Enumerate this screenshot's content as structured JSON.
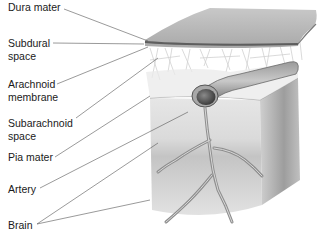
{
  "diagram": {
    "labels": [
      {
        "id": "dura-mater",
        "lines": [
          "Dura mater"
        ],
        "x": 8,
        "y": 1
      },
      {
        "id": "subdural-space",
        "lines": [
          "Subdural",
          "space"
        ],
        "x": 8,
        "y": 37
      },
      {
        "id": "arachnoid-membrane",
        "lines": [
          "Arachnoid",
          "membrane"
        ],
        "x": 8,
        "y": 78
      },
      {
        "id": "subarachnoid-space",
        "lines": [
          "Subarachnoid",
          "space"
        ],
        "x": 8,
        "y": 117
      },
      {
        "id": "pia-mater",
        "lines": [
          "Pia mater"
        ],
        "x": 8,
        "y": 154
      },
      {
        "id": "artery",
        "lines": [
          "Artery"
        ],
        "x": 8,
        "y": 186
      },
      {
        "id": "brain",
        "lines": [
          "Brain"
        ],
        "x": 8,
        "y": 220
      }
    ],
    "colors": {
      "dura": "#b3b3b3",
      "dura_edge": "#6e6e6e",
      "brain": "#d4d4d4",
      "brain_shadow": "#a8a8a8",
      "artery": "#8c8c8c",
      "leader": "#555555",
      "text": "#1a1a1a"
    }
  }
}
